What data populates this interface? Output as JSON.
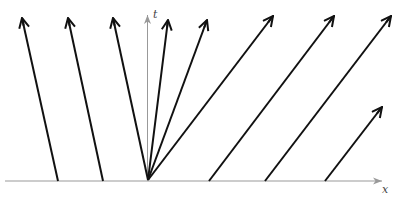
{
  "diagram": {
    "axes": {
      "x_label": "x",
      "t_label": "t",
      "axis_color": "#999999"
    },
    "arrow_color": "#111111",
    "arrows": [
      {
        "name": "characteristic-left-1",
        "x1": 58,
        "y1": 181,
        "x2": 22,
        "y2": 18
      },
      {
        "name": "characteristic-left-2",
        "x1": 103,
        "y1": 181,
        "x2": 68,
        "y2": 18
      },
      {
        "name": "fan-arrow-1",
        "x1": 148,
        "y1": 180,
        "x2": 113,
        "y2": 18
      },
      {
        "name": "fan-arrow-2",
        "x1": 148,
        "y1": 180,
        "x2": 168,
        "y2": 20
      },
      {
        "name": "fan-arrow-3",
        "x1": 148,
        "y1": 180,
        "x2": 207,
        "y2": 20
      },
      {
        "name": "fan-arrow-4",
        "x1": 148,
        "y1": 180,
        "x2": 273,
        "y2": 16
      },
      {
        "name": "characteristic-right-1",
        "x1": 209,
        "y1": 181,
        "x2": 334,
        "y2": 16
      },
      {
        "name": "characteristic-right-2",
        "x1": 265,
        "y1": 181,
        "x2": 391,
        "y2": 16
      },
      {
        "name": "characteristic-right-3",
        "x1": 325,
        "y1": 181,
        "x2": 382,
        "y2": 107
      }
    ]
  }
}
